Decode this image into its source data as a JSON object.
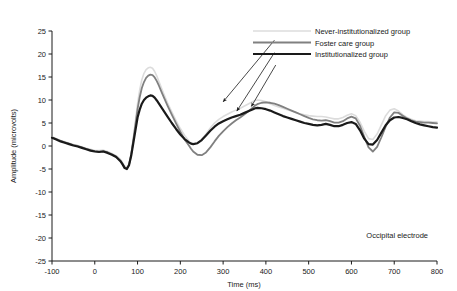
{
  "chart_data": {
    "type": "line",
    "title": "",
    "subtitle": "",
    "xlabel": "Time (ms)",
    "ylabel": "Amplitude (microvolts)",
    "xlim": [
      -100,
      800
    ],
    "ylim": [
      -25,
      25
    ],
    "xticks": [
      -100,
      0,
      100,
      200,
      300,
      400,
      500,
      600,
      700,
      800
    ],
    "xtick_labels": [
      "-100",
      "0",
      "100",
      "200",
      "300",
      "400",
      "500",
      "600",
      "700",
      "800"
    ],
    "yticks": [
      -25,
      -20,
      -15,
      -10,
      -5,
      0,
      5,
      10,
      15,
      20,
      25
    ],
    "ytick_labels": [
      "-25",
      "-20",
      "-15",
      "-10",
      "-5",
      "0",
      "5",
      "10",
      "15",
      "20",
      "25"
    ],
    "grid": false,
    "legend_position": "upper-right-inside",
    "annotations": [
      {
        "name": "electrode-label",
        "text": "Occipital electrode",
        "x": 640,
        "y": -21.0
      }
    ],
    "pointer_arrows": [
      {
        "name": "arrow-never-institutionalized",
        "from_x": 420,
        "from_y": 23.0,
        "to_x": 300,
        "to_y": 9.6
      },
      {
        "name": "arrow-foster-care",
        "from_x": 420,
        "from_y": 20.3,
        "to_x": 332,
        "to_y": 7.6
      },
      {
        "name": "arrow-institutionalized",
        "from_x": 423,
        "from_y": 17.6,
        "to_x": 366,
        "to_y": 8.6
      }
    ],
    "x": [
      -100,
      -90,
      -80,
      -70,
      -60,
      -50,
      -40,
      -30,
      -20,
      -10,
      0,
      10,
      20,
      30,
      40,
      50,
      60,
      65,
      70,
      75,
      80,
      85,
      90,
      95,
      100,
      105,
      110,
      115,
      120,
      125,
      130,
      135,
      140,
      145,
      150,
      155,
      160,
      170,
      180,
      190,
      200,
      210,
      220,
      225,
      230,
      240,
      250,
      260,
      270,
      280,
      290,
      300,
      310,
      320,
      330,
      340,
      350,
      360,
      370,
      375,
      380,
      390,
      400,
      410,
      420,
      430,
      440,
      450,
      460,
      470,
      480,
      490,
      500,
      510,
      520,
      530,
      540,
      550,
      560,
      570,
      580,
      590,
      600,
      610,
      620,
      630,
      640,
      650,
      660,
      670,
      680,
      690,
      700,
      710,
      720,
      730,
      740,
      750,
      760,
      770,
      780,
      790,
      800
    ],
    "series": [
      {
        "name": "Never-institutionalized group",
        "color": "#dcdcdc",
        "linewidth": 1.6,
        "values": [
          2.0,
          1.6,
          1.2,
          0.9,
          0.6,
          0.3,
          0.1,
          -0.2,
          -0.5,
          -0.7,
          -1.0,
          -1.0,
          -0.9,
          -1.2,
          -1.6,
          -2.1,
          -2.9,
          -3.6,
          -4.4,
          -4.6,
          -3.8,
          -1.6,
          1.6,
          5.4,
          9.2,
          12.2,
          14.4,
          15.8,
          16.6,
          17.0,
          17.1,
          16.9,
          16.2,
          15.2,
          14.0,
          12.8,
          11.6,
          9.4,
          7.4,
          5.5,
          3.8,
          2.3,
          1.1,
          0.6,
          0.4,
          0.6,
          1.4,
          2.6,
          3.9,
          5.0,
          5.8,
          6.4,
          6.9,
          7.4,
          7.8,
          8.2,
          8.7,
          9.2,
          9.7,
          9.9,
          10.0,
          9.9,
          9.6,
          9.2,
          8.8,
          8.5,
          8.2,
          7.9,
          7.6,
          7.3,
          7.0,
          6.8,
          6.6,
          6.5,
          6.4,
          6.4,
          6.3,
          6.1,
          5.9,
          5.9,
          6.2,
          6.7,
          7.0,
          6.6,
          5.2,
          3.2,
          1.6,
          1.4,
          2.6,
          4.6,
          6.6,
          7.8,
          8.1,
          7.6,
          6.8,
          6.2,
          5.8,
          5.5,
          5.4,
          5.3,
          5.3,
          5.2,
          5.2
        ]
      },
      {
        "name": "Foster care group",
        "color": "#808080",
        "linewidth": 1.8,
        "values": [
          1.9,
          1.5,
          1.1,
          0.8,
          0.5,
          0.2,
          0.0,
          -0.3,
          -0.6,
          -0.9,
          -1.1,
          -1.2,
          -1.1,
          -1.4,
          -1.8,
          -2.3,
          -3.2,
          -3.9,
          -4.7,
          -4.9,
          -4.1,
          -1.9,
          1.2,
          4.6,
          8.0,
          10.6,
          12.6,
          13.9,
          14.8,
          15.3,
          15.5,
          15.4,
          14.9,
          14.1,
          13.1,
          12.0,
          10.9,
          8.8,
          6.8,
          4.9,
          3.1,
          1.4,
          0.1,
          -0.6,
          -1.2,
          -1.9,
          -2.0,
          -1.4,
          -0.3,
          1.0,
          2.2,
          3.2,
          4.1,
          4.9,
          5.6,
          6.2,
          6.9,
          7.6,
          8.4,
          8.8,
          9.1,
          9.4,
          9.5,
          9.4,
          9.2,
          8.9,
          8.5,
          8.1,
          7.7,
          7.3,
          6.9,
          6.5,
          6.1,
          5.8,
          5.6,
          5.5,
          5.6,
          5.4,
          5.1,
          5.1,
          5.4,
          6.0,
          6.4,
          6.0,
          4.4,
          2.0,
          -0.3,
          -1.2,
          -0.2,
          1.9,
          4.2,
          6.2,
          7.3,
          7.2,
          6.6,
          6.0,
          5.6,
          5.3,
          5.2,
          5.1,
          5.1,
          5.0,
          4.9
        ]
      },
      {
        "name": "Institutionalized group",
        "color": "#1a1a1a",
        "linewidth": 2.2,
        "values": [
          1.8,
          1.4,
          1.0,
          0.7,
          0.4,
          0.1,
          -0.1,
          -0.4,
          -0.7,
          -1.0,
          -1.2,
          -1.3,
          -1.2,
          -1.5,
          -1.9,
          -2.4,
          -3.3,
          -4.0,
          -4.8,
          -5.0,
          -4.2,
          -2.2,
          0.6,
          3.4,
          6.2,
          7.9,
          9.2,
          10.0,
          10.5,
          10.8,
          11.0,
          10.9,
          10.5,
          9.9,
          9.2,
          8.5,
          7.8,
          6.4,
          5.0,
          3.7,
          2.5,
          1.5,
          0.8,
          0.5,
          0.4,
          0.6,
          1.3,
          2.3,
          3.3,
          4.2,
          4.9,
          5.4,
          5.8,
          6.2,
          6.5,
          6.8,
          7.2,
          7.6,
          8.0,
          8.2,
          8.3,
          8.2,
          8.0,
          7.7,
          7.3,
          6.9,
          6.5,
          6.2,
          5.9,
          5.6,
          5.3,
          5.0,
          4.8,
          4.6,
          4.5,
          4.6,
          4.8,
          4.6,
          4.3,
          4.3,
          4.6,
          5.0,
          5.2,
          4.8,
          3.4,
          1.6,
          0.4,
          0.3,
          1.3,
          2.9,
          4.5,
          5.6,
          6.2,
          6.3,
          6.1,
          5.8,
          5.4,
          5.0,
          4.7,
          4.5,
          4.3,
          4.1,
          4.0
        ]
      }
    ]
  },
  "legend": {
    "items": [
      {
        "label": "Never-institutionalized group",
        "color": "#dcdcdc",
        "swatch_name": "legend-swatch-never-institutionalized"
      },
      {
        "label": "Foster care group",
        "color": "#808080",
        "swatch_name": "legend-swatch-foster-care"
      },
      {
        "label": "Institutionalized group",
        "color": "#1a1a1a",
        "swatch_name": "legend-swatch-institutionalized"
      }
    ]
  }
}
